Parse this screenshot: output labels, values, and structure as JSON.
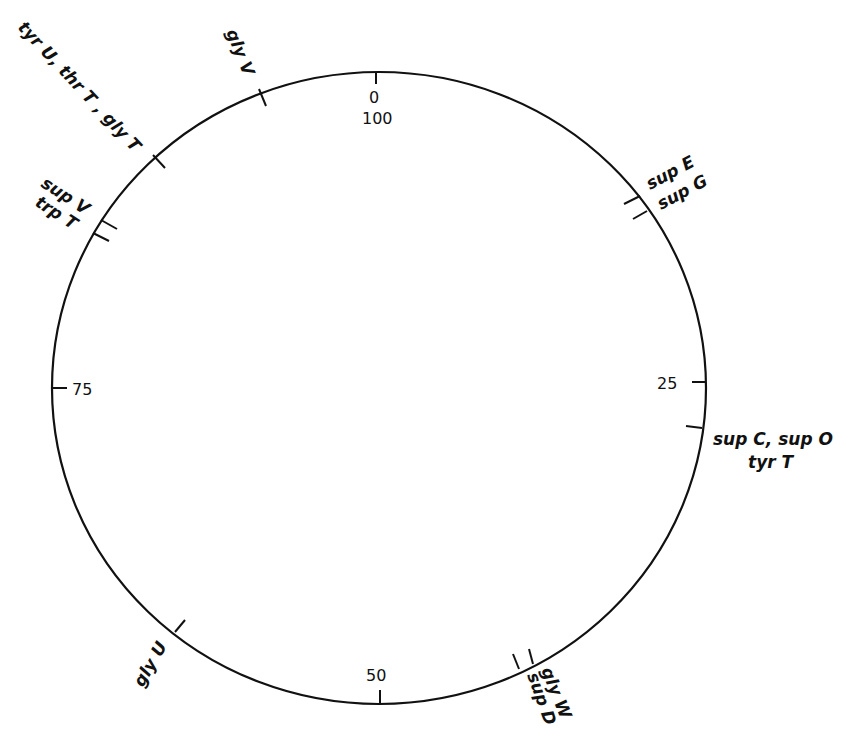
{
  "diagram": {
    "type": "circular genetic map",
    "scale": {
      "min": 0,
      "max": 100,
      "ticks": [
        {
          "value": "0",
          "label": "0"
        },
        {
          "value": "100",
          "label": "100"
        },
        {
          "value": "25",
          "label": "25"
        },
        {
          "value": "50",
          "label": "50"
        },
        {
          "value": "75",
          "label": "75"
        }
      ]
    },
    "loci": [
      {
        "id": "glyV",
        "label": "gly V"
      },
      {
        "id": "tyrU_thrT_glyT",
        "label": "tyr U, thr T , gly T"
      },
      {
        "id": "supV",
        "label": "sup V"
      },
      {
        "id": "trpT",
        "label": "trp T"
      },
      {
        "id": "supE",
        "label": "sup E"
      },
      {
        "id": "supG",
        "label": "sup G"
      },
      {
        "id": "supC_supO",
        "label": "sup C, sup O"
      },
      {
        "id": "tyrT",
        "label": "tyr T"
      },
      {
        "id": "glyW",
        "label": "gly W"
      },
      {
        "id": "supD",
        "label": "sup D"
      },
      {
        "id": "glyU",
        "label": "gly U"
      }
    ]
  },
  "colors": {
    "line": "#111111",
    "background": "#ffffff"
  }
}
